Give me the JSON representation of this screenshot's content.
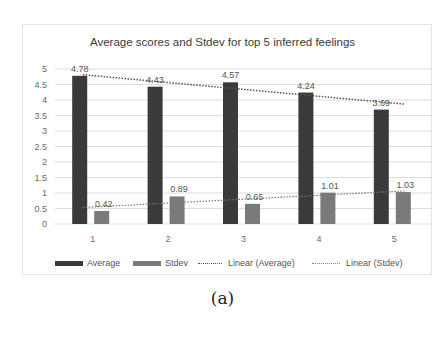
{
  "chart_data": {
    "type": "bar",
    "title": "Average scores and Stdev for top 5 inferred feelings",
    "xlabel": "",
    "ylabel": "",
    "categories": [
      "1",
      "2",
      "3",
      "4",
      "5"
    ],
    "series": [
      {
        "name": "Average",
        "values": [
          4.78,
          4.43,
          4.57,
          4.24,
          3.69
        ],
        "color": "#3a3a3a",
        "data_labels": [
          "4.78",
          "4.43",
          "4.57",
          "4.24",
          "3.69"
        ]
      },
      {
        "name": "Stdev",
        "values": [
          0.42,
          0.89,
          0.65,
          1.01,
          1.03
        ],
        "color": "#7a7a7a",
        "data_labels": [
          "0.42",
          "0.89",
          "0.65",
          "1.01",
          "1.03"
        ]
      }
    ],
    "trendlines": [
      {
        "name": "Linear (Average)",
        "of": "Average",
        "type": "linear",
        "start": 4.816,
        "end": 3.868,
        "style": "dotted",
        "color": "#555555"
      },
      {
        "name": "Linear (Stdev)",
        "of": "Stdev",
        "type": "linear",
        "start": 0.532,
        "end": 1.068,
        "style": "dotted",
        "color": "#777777"
      }
    ],
    "ylim": [
      0,
      5
    ],
    "yticks": [
      "0",
      "0.5",
      "1",
      "1.5",
      "2",
      "2.5",
      "3",
      "3.5",
      "4",
      "4.5",
      "5"
    ],
    "grid": true,
    "legend_position": "bottom",
    "legend": [
      "Average",
      "Stdev",
      "Linear (Average)",
      "Linear (Stdev)"
    ]
  },
  "caption": "(a)"
}
